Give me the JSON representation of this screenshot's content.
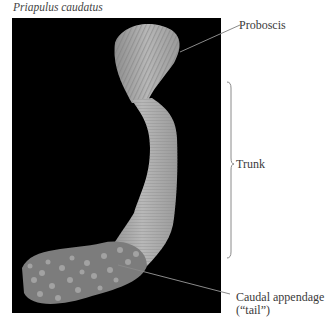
{
  "figure": {
    "title": "Priapulus caudatus",
    "labels": {
      "proboscis": "Proboscis",
      "trunk": "Trunk",
      "caudal_line1": "Caudal appendage",
      "caudal_line2": "(“tail”)"
    },
    "colors": {
      "background": "#000000",
      "body": "#a8a8a8",
      "leader_line": "#8a8a8a"
    }
  }
}
